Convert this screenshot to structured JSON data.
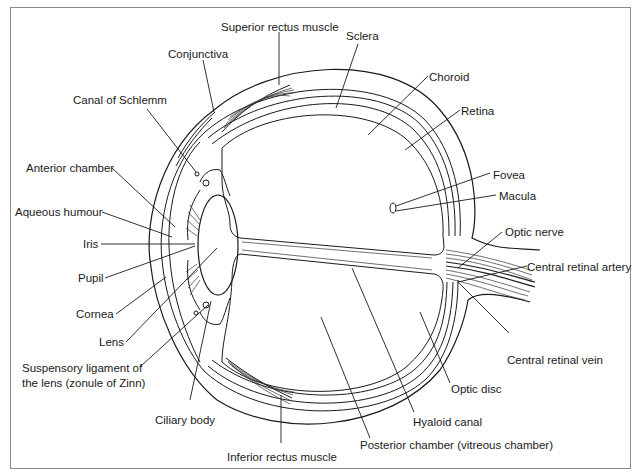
{
  "diagram": {
    "type": "anatomical cross-section",
    "labels": {
      "superior_rectus": "Superior rectus muscle",
      "sclera": "Sclera",
      "conjunctiva": "Conjunctiva",
      "choroid": "Choroid",
      "canal_of_schlemm": "Canal of Schlemm",
      "retina": "Retina",
      "anterior_chamber": "Anterior chamber",
      "fovea": "Fovea",
      "macula": "Macula",
      "aqueous_humour": "Aqueous humour",
      "iris": "Iris",
      "optic_nerve": "Optic nerve",
      "pupil": "Pupil",
      "central_retinal_artery": "Central retinal artery",
      "cornea": "Cornea",
      "lens": "Lens",
      "suspensory_ligament_line1": "Suspensory ligament of",
      "suspensory_ligament_line2": "the lens (zonule of Zinn)",
      "central_retinal_vein": "Central retinal vein",
      "optic_disc": "Optic disc",
      "ciliary_body": "Ciliary body",
      "hyaloid_canal": "Hyaloid canal",
      "inferior_rectus": "Inferior rectus muscle",
      "posterior_chamber": "Posterior chamber (vitreous chamber)"
    }
  }
}
